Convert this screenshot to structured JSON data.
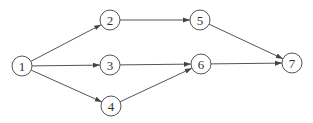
{
  "diagram": {
    "type": "directed-network",
    "stroke_color": "#555555",
    "nodes": [
      {
        "id": "1",
        "label": "1",
        "x": 22,
        "y": 66
      },
      {
        "id": "2",
        "label": "2",
        "x": 110,
        "y": 20
      },
      {
        "id": "3",
        "label": "3",
        "x": 110,
        "y": 65
      },
      {
        "id": "4",
        "label": "4",
        "x": 111,
        "y": 106
      },
      {
        "id": "5",
        "label": "5",
        "x": 200,
        "y": 20
      },
      {
        "id": "6",
        "label": "6",
        "x": 201,
        "y": 64
      },
      {
        "id": "7",
        "label": "7",
        "x": 292,
        "y": 63
      }
    ],
    "edges": [
      {
        "from": "1",
        "to": "2"
      },
      {
        "from": "1",
        "to": "3"
      },
      {
        "from": "1",
        "to": "4"
      },
      {
        "from": "2",
        "to": "5"
      },
      {
        "from": "3",
        "to": "6"
      },
      {
        "from": "4",
        "to": "6"
      },
      {
        "from": "5",
        "to": "7"
      },
      {
        "from": "6",
        "to": "7"
      }
    ]
  }
}
